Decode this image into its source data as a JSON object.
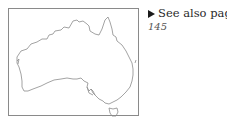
{
  "map": {
    "subject": "Australia outline map",
    "outline_color": "#8c8c8c",
    "frame_color": "#8a8a8a"
  },
  "cross_reference": {
    "icon": "right-triangle-arrow-icon",
    "label": "See also page",
    "page_number": "145"
  }
}
